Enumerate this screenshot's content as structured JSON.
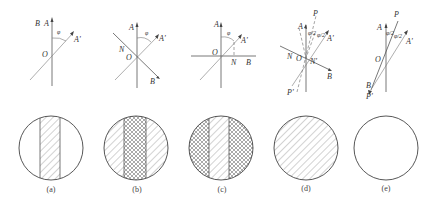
{
  "figure": {
    "colors": {
      "line": "#555555",
      "background": "#ffffff"
    },
    "panels": [
      {
        "id": "a",
        "caption": "(a)",
        "labels": {
          "A": "A",
          "B": "B",
          "O": "O",
          "A_prime": "A'",
          "angle": "φ"
        },
        "pattern": "center-band-hatched"
      },
      {
        "id": "b",
        "caption": "(b)",
        "labels": {
          "A": "A",
          "B": "B",
          "O": "O",
          "N": "N",
          "A_prime": "A'",
          "angle": "φ"
        },
        "pattern": "center-band-crosshatched-sides-hatched"
      },
      {
        "id": "c",
        "caption": "(c)",
        "labels": {
          "A": "A",
          "B": "B",
          "O": "O",
          "N": "N",
          "A_prime": "A'",
          "angle": "φ"
        },
        "pattern": "center-band-hatched-sides-crosshatched"
      },
      {
        "id": "d",
        "caption": "(d)",
        "labels": {
          "A": "A",
          "B": "B",
          "O": "O",
          "N": "N",
          "N_prime": "N'",
          "A_prime": "A'",
          "P": "P",
          "P_prime": "P'",
          "half_angle": "φ/2"
        },
        "pattern": "uniform-hatched"
      },
      {
        "id": "e",
        "caption": "(e)",
        "labels": {
          "A": "A",
          "B": "B",
          "O": "O",
          "A_prime": "A'",
          "P": "P",
          "P_prime": "P'",
          "half_angle": "φ/2"
        },
        "pattern": "uniform-clear"
      }
    ]
  }
}
